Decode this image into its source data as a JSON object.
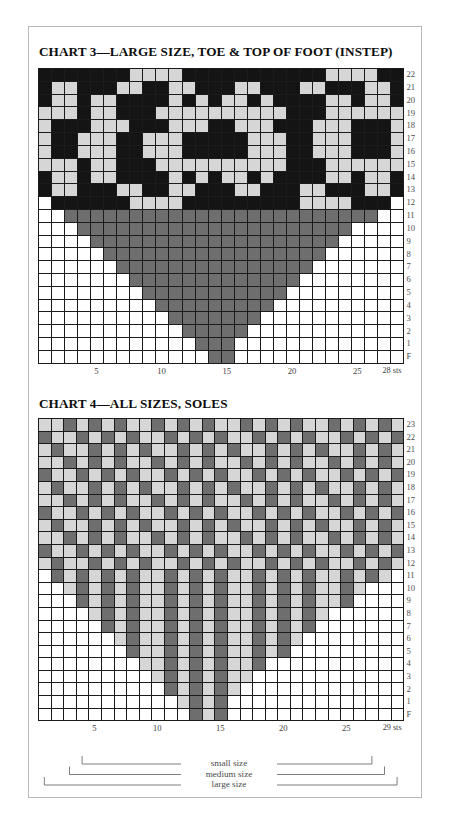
{
  "charts": [
    {
      "id": "chart3",
      "title": "CHART 3—LARGE SIZE, TOE & TOP OF FOOT (INSTEP)",
      "columns": 28,
      "row_labels": [
        "22",
        "21",
        "20",
        "19",
        "18",
        "17",
        "16",
        "15",
        "14",
        "13",
        "12",
        "11",
        "10",
        "9",
        "8",
        "7",
        "6",
        "5",
        "4",
        "3",
        "2",
        "1",
        "F"
      ],
      "col_labels": [
        {
          "text": "28 sts",
          "col": 1
        },
        {
          "text": "25",
          "col": 4
        },
        {
          "text": "20",
          "col": 9
        },
        {
          "text": "15",
          "col": 14
        },
        {
          "text": "10",
          "col": 19
        },
        {
          "text": "5",
          "col": 24
        }
      ],
      "legend": {
        "W": "white",
        "K": "black",
        "G": "gray",
        "L": "light gray",
        "D": "dark gray"
      },
      "rows": [
        "KKKKKKKLLLLKKKKKKKKKKKLLLLKK",
        "KLLKKKLLKKLLKKKLLKKKLLKKKLLK",
        "KLLKLLKKKKLKLKLLKLKKKKLLKLLK",
        "LLLKLLKKKLLLLLLLLLLKKKLLLLLL",
        "LKKKLLLKKKLLLKKLLLKKKLLLKKKL",
        "LKKLLLKKLLLKKKKKLLLKKLLLKKKL",
        "LKKLLLKKLLLKKKKKLLLKKLLLKKKL",
        "LLLKLLKKKLLLLLLLLLLKKKLLLLLL",
        "KLLKLLKKKKLKLKLLKLKKKKLLKLLK",
        "KLLKKKLLKKLLKKKLLKKKLLKKKLLK",
        "WKKKKKKLLLLKKKKKKKKKLLLLKKKW",
        "WWGGGGGGGGGGGGGGGGGGGGGGGGWW",
        "WWWGGGGGGGGGGGGGGGGGGGGGWWWW",
        "WWWWGGGGGGGGGGGGGGGGGGGWWWWW",
        "WWWWWGGGGGGGGGGGGGGGGGWWWWWW",
        "WWWWWWGGGGGGGGGGGGGGGWWWWWWW",
        "WWWWWWWGGGGGGGGGGGGGWWWWWWWW",
        "WWWWWWWWGGGGGGGGGGGWWWWWWWWW",
        "WWWWWWWWWGGGGGGGGGWWWWWWWWWW",
        "WWWWWWWWWWGGGGGGGWWWWWWWWWWW",
        "WWWWWWWWWWWGGGGGWWWWWWWWWWWW",
        "WWWWWWWWWWWWGGGWWWWWWWWWWWWW",
        "WWWWWWWWWWWWWGGWWWWWWWWWWWWW"
      ]
    },
    {
      "id": "chart4",
      "title": "CHART 4—ALL SIZES, SOLES",
      "columns": 29,
      "row_labels": [
        "23",
        "22",
        "21",
        "20",
        "19",
        "18",
        "17",
        "16",
        "15",
        "14",
        "13",
        "12",
        "11",
        "10",
        "9",
        "8",
        "7",
        "6",
        "5",
        "4",
        "3",
        "2",
        "1",
        "F"
      ],
      "col_labels": [
        {
          "text": "29 sts",
          "col": 1
        },
        {
          "text": "25",
          "col": 5
        },
        {
          "text": "20",
          "col": 10
        },
        {
          "text": "15",
          "col": 15
        },
        {
          "text": "10",
          "col": 20
        },
        {
          "text": "5",
          "col": 25
        }
      ],
      "rows": [
        "LLGLGLGLLGLGLGLLGLGLGLLGLGLGL",
        "GLLGLGLGLLGLGLGLLGLGLGLLGLGLG",
        "LGLLGLGLGLLGLGLGLLGLGLGLLGLGL",
        "LLGLGLGLLGLGLGLLGLGLGLLGLGLGL",
        "GLLGLGLGLLGLGLGLLGLGLGLLGLGLG",
        "LGLLGLGLGLLGLGLGLLGLGLGLLGLGL",
        "LLGLGLGLLGLGLGLLGLGLGLLGLGLGL",
        "GLLGLGLGLLGLGLGLLGLGLGLLGLGLG",
        "LGLLGLGLGLLGLGLGLLGLGLGLLGLGL",
        "LLGLGLGLLGLGLGLLGLGLGLLGLGLGL",
        "GLLGLGLGLLGLGLGLLGLGLGLLGLGLG",
        "LGLLGLGLGLLGLGLGLLGLGLGLLGLGL",
        "WGLGLGLGLLGLGLGLLGLGLGLLGLGLW",
        "WWLGLGLGLLGLGLGLLGLGLGLLGLWWW",
        "WWWGLGLGLLGLGLGLLGLGLGLLGWWWW",
        "WWWWLGLGLLGLGLGLLGLGLGLWWWWWW",
        "WWWWWGLGLLGLGLGLLGLGLGWWWWWWW",
        "WWWWWWLGLLGLGLGLLGLGLWWWWWWWW",
        "WWWWWWWGLLGLGLGLLGLGWWWWWWWWW",
        "WWWWWWWWLLGLGLGLLGWWWWWWWWWWW",
        "WWWWWWWWWLGLGLGLLWWWWWWWWWWWW",
        "WWWWWWWWWWGLGLGLWWWWWWWWWWWWW",
        "WWWWWWWWWWWLGLGWWWWWWWWWWWWWW",
        "WWWWWWWWWWWWGLGWWWWWWWWWWWWWW"
      ]
    }
  ],
  "size_brackets": [
    {
      "label": "small size",
      "left_col": 3,
      "right_col": 26
    },
    {
      "label": "medium size",
      "left_col": 2,
      "right_col": 27
    },
    {
      "label": "large size",
      "left_col": 1,
      "right_col": 29
    }
  ]
}
